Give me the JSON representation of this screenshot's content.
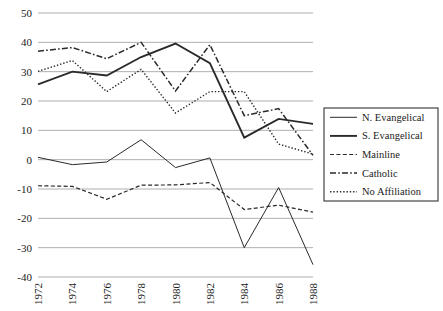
{
  "chart_data": {
    "type": "line",
    "title": "",
    "subtitle": "",
    "xlabel": "",
    "ylabel": "",
    "x": [
      1972,
      1974,
      1976,
      1978,
      1980,
      1982,
      1984,
      1986,
      1988
    ],
    "xtick_labels": [
      "1972",
      "1974",
      "1976",
      "1978",
      "1980",
      "1982",
      "1984",
      "1986",
      "1988"
    ],
    "ytick_labels": [
      "50",
      "40",
      "30",
      "20",
      "10",
      "0",
      "-10",
      "-20",
      "-30",
      "-40"
    ],
    "ytick_values": [
      50,
      40,
      30,
      20,
      10,
      0,
      -10,
      -20,
      -30,
      -40
    ],
    "xlim": [
      1972,
      1988
    ],
    "ylim": [
      -40,
      50
    ],
    "grid": "horizontal",
    "legend_position": "right-outside",
    "series": [
      {
        "name": "N. Evangelical",
        "style": "solid-thin",
        "values": [
          0.8,
          -1.7,
          -0.8,
          6.8,
          -2.7,
          0.6,
          -30.0,
          -9.5,
          -35.8
        ]
      },
      {
        "name": "S. Evangelical",
        "style": "solid-thick",
        "values": [
          25.7,
          30.0,
          28.7,
          35.0,
          39.6,
          32.9,
          7.5,
          13.9,
          12.2
        ]
      },
      {
        "name": "Mainline",
        "style": "dashed",
        "values": [
          -8.9,
          -9.1,
          -13.5,
          -8.7,
          -8.6,
          -7.8,
          -17.0,
          -15.5,
          -17.9
        ]
      },
      {
        "name": "Catholic",
        "style": "dash-dot",
        "values": [
          37.0,
          38.2,
          34.4,
          40.0,
          23.4,
          39.2,
          15.0,
          17.4,
          1.5
        ]
      },
      {
        "name": "No Affiliation",
        "style": "dotted",
        "values": [
          30.1,
          33.8,
          23.2,
          30.8,
          15.9,
          23.2,
          23.2,
          5.3,
          1.9
        ]
      }
    ]
  },
  "legend": {
    "entries": [
      {
        "label": "N. Evangelical"
      },
      {
        "label": "S. Evangelical"
      },
      {
        "label": "Mainline"
      },
      {
        "label": "Catholic"
      },
      {
        "label": "No Affiliation"
      }
    ]
  },
  "colors": {
    "line": "#2a2a2a",
    "grid": "#9a9a9a",
    "text": "#1a1a1a",
    "background": "#ffffff",
    "legend_border": "#333333"
  }
}
